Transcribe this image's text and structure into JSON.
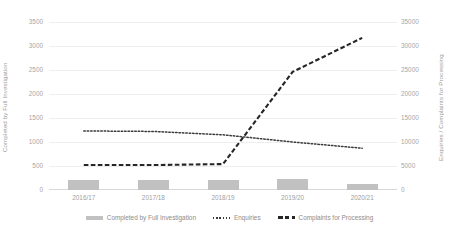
{
  "chart_data": {
    "type": "bar",
    "title": "",
    "categories": [
      "2016/17",
      "2017/18",
      "2018/19",
      "2019/20",
      "2020/21"
    ],
    "xlabel": "",
    "grid": true,
    "legend_position": "bottom",
    "axes": {
      "left": {
        "label": "Completed by Full Investigation",
        "ticks": [
          0,
          500,
          1000,
          1500,
          2000,
          2500,
          3000,
          3500
        ],
        "tick_labels": [
          "0",
          "500",
          "1000",
          "1500",
          "2000",
          "2500",
          "3000",
          "3500"
        ],
        "ylim": [
          0,
          3500
        ]
      },
      "right": {
        "label": "Enquiries / Complaints for Processing",
        "ticks": [
          0,
          5000,
          10000,
          15000,
          20000,
          25000,
          30000,
          35000
        ],
        "tick_labels": [
          "0",
          "5000",
          "10000",
          "15000",
          "20000",
          "25000",
          "30000",
          "35000"
        ],
        "ylim": [
          0,
          35000
        ]
      }
    },
    "series": [
      {
        "name": "Completed by Full Investigation",
        "type": "bar",
        "axis": "left",
        "color": "#c1c1c1",
        "values": [
          200,
          205,
          215,
          220,
          130
        ]
      },
      {
        "name": "Enquiries",
        "type": "line",
        "style": "dotted",
        "axis": "right",
        "color": "#3b3b3b",
        "values": [
          12300,
          12200,
          11500,
          10000,
          8700
        ]
      },
      {
        "name": "Complaints for Processing",
        "type": "line",
        "style": "dashed",
        "axis": "right",
        "color": "#262626",
        "values": [
          5200,
          5200,
          5400,
          24600,
          31700
        ]
      }
    ]
  }
}
